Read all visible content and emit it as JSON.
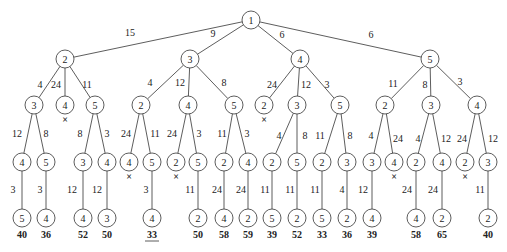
{
  "style": {
    "stroke": "#333333",
    "node_fill": "#ffffff",
    "text": "#222222",
    "node_radius": 9
  },
  "nodes": [
    {
      "id": "n0",
      "label": "1",
      "x": 251,
      "y": 20
    },
    {
      "id": "a",
      "label": "2",
      "x": 65,
      "y": 59,
      "parent": "n0",
      "edge": "15",
      "ex": 130,
      "ey": 36
    },
    {
      "id": "b",
      "label": "3",
      "x": 190,
      "y": 59,
      "parent": "n0",
      "edge": "9",
      "ex": 213,
      "ey": 37
    },
    {
      "id": "c",
      "label": "4",
      "x": 300,
      "y": 59,
      "parent": "n0",
      "edge": "6",
      "ex": 282,
      "ey": 38
    },
    {
      "id": "d",
      "label": "5",
      "x": 430,
      "y": 59,
      "parent": "n0",
      "edge": "6",
      "ex": 371,
      "ey": 38
    },
    {
      "id": "a1",
      "label": "3",
      "x": 34,
      "y": 105,
      "parent": "a",
      "edge": "4",
      "ex": 40,
      "ey": 88
    },
    {
      "id": "a2",
      "label": "4",
      "x": 65,
      "y": 105,
      "parent": "a",
      "edge": "24",
      "ex": 56,
      "ey": 88,
      "pruned": true
    },
    {
      "id": "a3",
      "label": "5",
      "x": 95,
      "y": 105,
      "parent": "a",
      "edge": "11",
      "ex": 87,
      "ey": 88
    },
    {
      "id": "b1",
      "label": "2",
      "x": 141,
      "y": 105,
      "parent": "b",
      "edge": "4",
      "ex": 150,
      "ey": 86
    },
    {
      "id": "b2",
      "label": "4",
      "x": 188,
      "y": 105,
      "parent": "b",
      "edge": "12",
      "ex": 180,
      "ey": 86
    },
    {
      "id": "b3",
      "label": "5",
      "x": 234,
      "y": 105,
      "parent": "b",
      "edge": "8",
      "ex": 224,
      "ey": 86
    },
    {
      "id": "c1",
      "label": "2",
      "x": 264,
      "y": 105,
      "parent": "c",
      "edge": "24",
      "ex": 272,
      "ey": 88,
      "pruned": true
    },
    {
      "id": "c2",
      "label": "3",
      "x": 297,
      "y": 105,
      "parent": "c",
      "edge": "12",
      "ex": 306,
      "ey": 88
    },
    {
      "id": "c3",
      "label": "5",
      "x": 340,
      "y": 105,
      "parent": "c",
      "edge": "3",
      "ex": 327,
      "ey": 88
    },
    {
      "id": "d1",
      "label": "2",
      "x": 385,
      "y": 105,
      "parent": "d",
      "edge": "11",
      "ex": 393,
      "ey": 87
    },
    {
      "id": "d2",
      "label": "3",
      "x": 431,
      "y": 105,
      "parent": "d",
      "edge": "8",
      "ex": 425,
      "ey": 88
    },
    {
      "id": "d3",
      "label": "4",
      "x": 477,
      "y": 105,
      "parent": "d",
      "edge": "3",
      "ex": 460,
      "ey": 85
    },
    {
      "id": "a11",
      "label": "4",
      "x": 22,
      "y": 162,
      "parent": "a1",
      "edge": "12",
      "ex": 17,
      "ey": 137
    },
    {
      "id": "a12",
      "label": "5",
      "x": 46,
      "y": 162,
      "parent": "a1",
      "edge": "8",
      "ex": 46,
      "ey": 137
    },
    {
      "id": "a31",
      "label": "3",
      "x": 83,
      "y": 162,
      "parent": "a3",
      "edge": "8",
      "ex": 80,
      "ey": 137
    },
    {
      "id": "a32",
      "label": "4",
      "x": 107,
      "y": 162,
      "parent": "a3",
      "edge": "3",
      "ex": 107,
      "ey": 137
    },
    {
      "id": "b11",
      "label": "4",
      "x": 129,
      "y": 162,
      "parent": "b1",
      "edge": "24",
      "ex": 126,
      "ey": 137,
      "pruned": true
    },
    {
      "id": "b12",
      "label": "5",
      "x": 152,
      "y": 162,
      "parent": "b1",
      "edge": "11",
      "ex": 155,
      "ey": 137
    },
    {
      "id": "b21",
      "label": "2",
      "x": 176,
      "y": 162,
      "parent": "b2",
      "edge": "24",
      "ex": 172,
      "ey": 137,
      "pruned": true
    },
    {
      "id": "b22",
      "label": "5",
      "x": 198,
      "y": 162,
      "parent": "b2",
      "edge": "3",
      "ex": 199,
      "ey": 137
    },
    {
      "id": "b31",
      "label": "2",
      "x": 224,
      "y": 162,
      "parent": "b3",
      "edge": "11",
      "ex": 222,
      "ey": 137
    },
    {
      "id": "b32",
      "label": "4",
      "x": 248,
      "y": 162,
      "parent": "b3",
      "edge": "3",
      "ex": 247,
      "ey": 137
    },
    {
      "id": "c21",
      "label": "2",
      "x": 272,
      "y": 162,
      "parent": "c2",
      "edge": "4",
      "ex": 279,
      "ey": 139
    },
    {
      "id": "c22",
      "label": "5",
      "x": 297,
      "y": 162,
      "parent": "c2",
      "edge": "8",
      "ex": 305,
      "ey": 139
    },
    {
      "id": "c31",
      "label": "2",
      "x": 322,
      "y": 162,
      "parent": "c3",
      "edge": "11",
      "ex": 320,
      "ey": 139
    },
    {
      "id": "c32",
      "label": "3",
      "x": 347,
      "y": 162,
      "parent": "c3",
      "edge": "8",
      "ex": 350,
      "ey": 139
    },
    {
      "id": "d11",
      "label": "3",
      "x": 372,
      "y": 162,
      "parent": "d1",
      "edge": "4",
      "ex": 371,
      "ey": 139
    },
    {
      "id": "d12",
      "label": "4",
      "x": 394,
      "y": 162,
      "parent": "d1",
      "edge": "24",
      "ex": 398,
      "ey": 142,
      "pruned": true
    },
    {
      "id": "d21",
      "label": "2",
      "x": 416,
      "y": 162,
      "parent": "d2",
      "edge": "4",
      "ex": 418,
      "ey": 142
    },
    {
      "id": "d22",
      "label": "4",
      "x": 442,
      "y": 162,
      "parent": "d2",
      "edge": "12",
      "ex": 446,
      "ey": 142
    },
    {
      "id": "d31",
      "label": "2",
      "x": 465,
      "y": 162,
      "parent": "d3",
      "edge": "24",
      "ex": 462,
      "ey": 142,
      "pruned": true
    },
    {
      "id": "d32",
      "label": "3",
      "x": 488,
      "y": 162,
      "parent": "d3",
      "edge": "12",
      "ex": 493,
      "ey": 142
    },
    {
      "id": "a111",
      "label": "5",
      "x": 22,
      "y": 218,
      "parent": "a11",
      "edge": "3",
      "ex": 13,
      "ey": 193,
      "bound": "40"
    },
    {
      "id": "a121",
      "label": "4",
      "x": 46,
      "y": 218,
      "parent": "a12",
      "edge": "3",
      "ex": 40,
      "ey": 193,
      "bound": "36"
    },
    {
      "id": "a311",
      "label": "4",
      "x": 83,
      "y": 218,
      "parent": "a31",
      "edge": "12",
      "ex": 72,
      "ey": 193,
      "bound": "52"
    },
    {
      "id": "a321",
      "label": "3",
      "x": 107,
      "y": 218,
      "parent": "a32",
      "edge": "12",
      "ex": 97,
      "ey": 193,
      "bound": "50"
    },
    {
      "id": "b121",
      "label": "4",
      "x": 152,
      "y": 218,
      "parent": "b12",
      "edge": "3",
      "ex": 146,
      "ey": 193,
      "bound": "33",
      "best": true
    },
    {
      "id": "b221",
      "label": "2",
      "x": 198,
      "y": 218,
      "parent": "b22",
      "edge": "11",
      "ex": 190,
      "ey": 193,
      "bound": "50"
    },
    {
      "id": "b311",
      "label": "4",
      "x": 224,
      "y": 218,
      "parent": "b31",
      "edge": "24",
      "ex": 217,
      "ey": 193,
      "bound": "58"
    },
    {
      "id": "b321",
      "label": "2",
      "x": 248,
      "y": 218,
      "parent": "b32",
      "edge": "24",
      "ex": 241,
      "ey": 193,
      "bound": "59"
    },
    {
      "id": "c211",
      "label": "5",
      "x": 272,
      "y": 218,
      "parent": "c21",
      "edge": "11",
      "ex": 265,
      "ey": 193,
      "bound": "39"
    },
    {
      "id": "c221",
      "label": "2",
      "x": 297,
      "y": 218,
      "parent": "c22",
      "edge": "11",
      "ex": 290,
      "ey": 193,
      "bound": "52"
    },
    {
      "id": "c311",
      "label": "5",
      "x": 322,
      "y": 218,
      "parent": "c31",
      "edge": "11",
      "ex": 315,
      "ey": 193,
      "bound": "33"
    },
    {
      "id": "c321",
      "label": "2",
      "x": 347,
      "y": 218,
      "parent": "c32",
      "edge": "4",
      "ex": 342,
      "ey": 193,
      "bound": "36"
    },
    {
      "id": "d111",
      "label": "4",
      "x": 372,
      "y": 218,
      "parent": "d11",
      "edge": "12",
      "ex": 363,
      "ey": 193,
      "bound": "39"
    },
    {
      "id": "d211",
      "label": "4",
      "x": 416,
      "y": 218,
      "parent": "d21",
      "edge": "24",
      "ex": 407,
      "ey": 193,
      "bound": "58"
    },
    {
      "id": "d221",
      "label": "2",
      "x": 442,
      "y": 218,
      "parent": "d22",
      "edge": "24",
      "ex": 433,
      "ey": 193,
      "bound": "65"
    },
    {
      "id": "d321",
      "label": "2",
      "x": 488,
      "y": 218,
      "parent": "d32",
      "edge": "11",
      "ex": 480,
      "ey": 193,
      "bound": "40"
    }
  ],
  "pruned_marker": "×"
}
